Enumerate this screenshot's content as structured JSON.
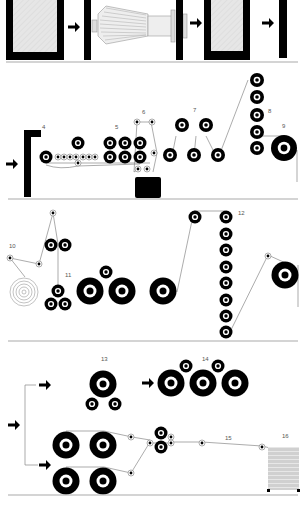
{
  "diagram": {
    "title": "",
    "colors": {
      "ink": "#000000",
      "paper": "#ffffff",
      "thread": "#888888",
      "frame_fill": "#e6e6e6",
      "baseline": "#aaaaaa",
      "stack_fill": "#d8d8d8"
    },
    "stages": [
      {
        "id": "4",
        "label": "4"
      },
      {
        "id": "5",
        "label": "5"
      },
      {
        "id": "6",
        "label": "6"
      },
      {
        "id": "7",
        "label": "7"
      },
      {
        "id": "8",
        "label": "8"
      },
      {
        "id": "9",
        "label": "9"
      },
      {
        "id": "10",
        "label": "10"
      },
      {
        "id": "11",
        "label": "11"
      },
      {
        "id": "12",
        "label": "12"
      },
      {
        "id": "13",
        "label": "13"
      },
      {
        "id": "14",
        "label": "14"
      },
      {
        "id": "15",
        "label": "15"
      },
      {
        "id": "16",
        "label": "16"
      }
    ],
    "icons": {
      "arrow": "right-arrow-icon",
      "roller": "roller-icon",
      "guide": "guide-pulley-icon",
      "reel": "yarn-reel-icon",
      "cone": "spinning-cone-icon",
      "frame": "machine-frame-icon",
      "bale": "bale-stack-icon",
      "coil": "coil-icon"
    }
  }
}
